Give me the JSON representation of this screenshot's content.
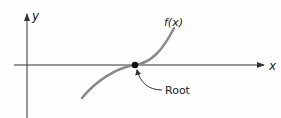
{
  "diagram": {
    "axes": {
      "x_label": "x",
      "y_label": "y"
    },
    "curve_label": "f(x)",
    "root_label": "Root",
    "colors": {
      "axis": "#333333",
      "curve": "#8a8a8a",
      "root_point": "#111111",
      "background": "#fefefe"
    }
  }
}
